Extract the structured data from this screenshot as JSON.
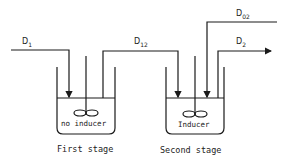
{
  "diagram": {
    "stages": [
      {
        "label": "First stage",
        "tank_label": "no inducer"
      },
      {
        "label": "Second stage",
        "tank_label": "Inducer"
      }
    ],
    "flows": [
      {
        "id": "D1",
        "base": "D",
        "sub": "1"
      },
      {
        "id": "D12",
        "base": "D",
        "sub": "12"
      },
      {
        "id": "D02",
        "base": "D",
        "sub": "02"
      },
      {
        "id": "D2",
        "base": "D",
        "sub": "2"
      }
    ],
    "line_color": "#1a1a1a"
  }
}
